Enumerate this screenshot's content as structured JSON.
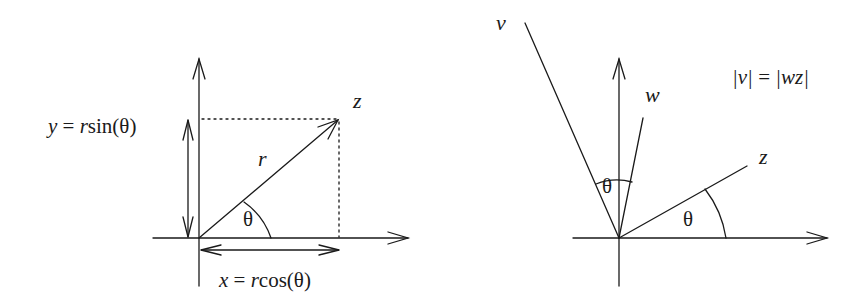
{
  "left_diagram": {
    "title": "polar coordinates of a complex number",
    "labels": {
      "y_eq_prefix": "y",
      "y_eq_mid": " = ",
      "y_eq_r": "r",
      "y_eq_fn": "sin(θ)",
      "x_eq_prefix": "x",
      "x_eq_mid": " = ",
      "x_eq_r": "r",
      "x_eq_fn": "cos(θ)",
      "point": "z",
      "radius": "r",
      "angle": "θ"
    }
  },
  "right_diagram": {
    "title": "rotation by multiplication",
    "labels": {
      "v": "v",
      "w": "w",
      "z": "z",
      "angle_vw": "θ",
      "angle_z": "θ",
      "identity_left": "|v|",
      "identity_eq": " = ",
      "identity_right": "|wz|"
    }
  },
  "colors": {
    "stroke": "#1a1a1a",
    "background": "#ffffff"
  }
}
